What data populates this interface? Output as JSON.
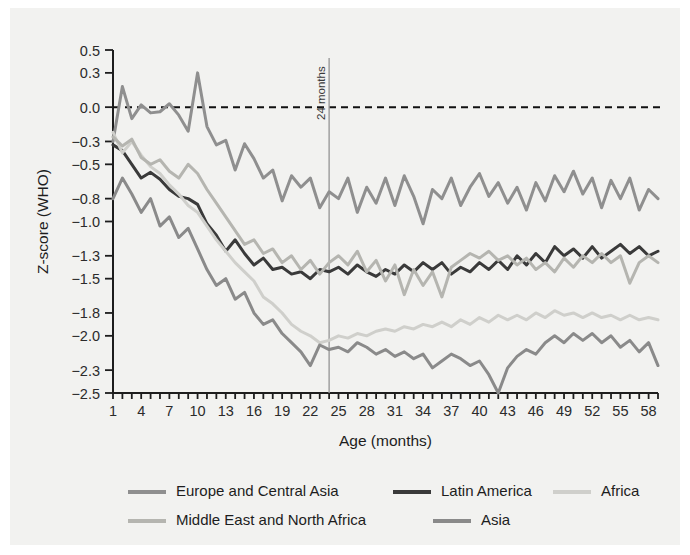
{
  "figure": {
    "background": "#f2f2f0",
    "page_background": "#ffffff"
  },
  "chart_data": {
    "type": "line",
    "title": "",
    "xlabel": "Age (months)",
    "ylabel": "Z-score (WHO)",
    "xlim": [
      1,
      59
    ],
    "ylim": [
      -2.5,
      0.5
    ],
    "grid": false,
    "legend_position": "bottom",
    "y_ticks": [
      0.5,
      0.3,
      0.0,
      -0.3,
      -0.5,
      -0.8,
      -1.0,
      -1.3,
      -1.5,
      -1.8,
      -2.0,
      -2.3,
      -2.5
    ],
    "y_tick_labels": [
      "0.5",
      "0.3",
      "0.0",
      "−0.3",
      "−0.5",
      "−0.8",
      "−1.0",
      "−1.3",
      "−1.5",
      "−1.8",
      "−2.0",
      "−2.3",
      "−2.5"
    ],
    "x_ticks": [
      1,
      4,
      7,
      10,
      13,
      16,
      19,
      22,
      25,
      28,
      31,
      34,
      37,
      40,
      43,
      46,
      49,
      52,
      55,
      58
    ],
    "x_tick_labels": [
      "1",
      "4",
      "7",
      "10",
      "13",
      "16",
      "19",
      "22",
      "25",
      "28",
      "31",
      "34",
      "37",
      "40",
      "43",
      "46",
      "49",
      "52",
      "55",
      "58"
    ],
    "x_minor_step": 1,
    "annotations": [
      {
        "text": "24 months",
        "x": 24,
        "orientation": "vertical",
        "line_color": "#9a9a9a"
      }
    ],
    "reference_lines": [
      {
        "y": 0.0,
        "style": "dashed",
        "color": "#111111"
      }
    ],
    "x": [
      1,
      2,
      3,
      4,
      5,
      6,
      7,
      8,
      9,
      10,
      11,
      12,
      13,
      14,
      15,
      16,
      17,
      18,
      19,
      20,
      21,
      22,
      23,
      24,
      25,
      26,
      27,
      28,
      29,
      30,
      31,
      32,
      33,
      34,
      35,
      36,
      37,
      38,
      39,
      40,
      41,
      42,
      43,
      44,
      45,
      46,
      47,
      48,
      49,
      50,
      51,
      52,
      53,
      54,
      55,
      56,
      57,
      58,
      59
    ],
    "series": [
      {
        "name": "Europe and Central Asia",
        "color": "#8f8f8f",
        "width": 3.0,
        "values": [
          -0.3,
          0.18,
          -0.1,
          0.02,
          -0.05,
          -0.04,
          0.03,
          -0.07,
          -0.21,
          0.3,
          -0.17,
          -0.33,
          -0.29,
          -0.55,
          -0.32,
          -0.45,
          -0.62,
          -0.55,
          -0.82,
          -0.6,
          -0.7,
          -0.62,
          -0.88,
          -0.74,
          -0.8,
          -0.62,
          -0.92,
          -0.7,
          -0.84,
          -0.62,
          -0.86,
          -0.6,
          -0.78,
          -1.02,
          -0.72,
          -0.8,
          -0.62,
          -0.86,
          -0.7,
          -0.58,
          -0.78,
          -0.66,
          -0.84,
          -0.7,
          -0.9,
          -0.66,
          -0.82,
          -0.6,
          -0.74,
          -0.56,
          -0.76,
          -0.62,
          -0.88,
          -0.64,
          -0.8,
          -0.62,
          -0.9,
          -0.72,
          -0.8
        ]
      },
      {
        "name": "Latin America",
        "color": "#3a3a3a",
        "width": 3.0,
        "values": [
          -0.33,
          -0.38,
          -0.5,
          -0.62,
          -0.57,
          -0.63,
          -0.72,
          -0.78,
          -0.8,
          -0.85,
          -1.02,
          -1.12,
          -1.26,
          -1.16,
          -1.28,
          -1.38,
          -1.32,
          -1.42,
          -1.4,
          -1.46,
          -1.44,
          -1.5,
          -1.42,
          -1.44,
          -1.4,
          -1.46,
          -1.38,
          -1.44,
          -1.48,
          -1.42,
          -1.46,
          -1.38,
          -1.44,
          -1.36,
          -1.42,
          -1.36,
          -1.46,
          -1.4,
          -1.44,
          -1.36,
          -1.42,
          -1.34,
          -1.42,
          -1.3,
          -1.38,
          -1.28,
          -1.36,
          -1.22,
          -1.3,
          -1.24,
          -1.32,
          -1.22,
          -1.32,
          -1.26,
          -1.2,
          -1.28,
          -1.22,
          -1.3,
          -1.26
        ]
      },
      {
        "name": "Africa",
        "color": "#cfcfcb",
        "width": 3.0,
        "values": [
          -0.22,
          -0.4,
          -0.3,
          -0.42,
          -0.52,
          -0.58,
          -0.68,
          -0.76,
          -0.86,
          -0.92,
          -1.04,
          -1.16,
          -1.26,
          -1.36,
          -1.44,
          -1.52,
          -1.66,
          -1.72,
          -1.8,
          -1.9,
          -1.96,
          -2.0,
          -2.06,
          -2.04,
          -2.0,
          -2.02,
          -1.98,
          -2.0,
          -1.96,
          -1.94,
          -1.96,
          -1.92,
          -1.94,
          -1.9,
          -1.92,
          -1.88,
          -1.92,
          -1.86,
          -1.9,
          -1.84,
          -1.88,
          -1.82,
          -1.86,
          -1.82,
          -1.86,
          -1.8,
          -1.84,
          -1.78,
          -1.82,
          -1.8,
          -1.84,
          -1.8,
          -1.84,
          -1.82,
          -1.86,
          -1.82,
          -1.86,
          -1.84,
          -1.86
        ]
      },
      {
        "name": "Middle East and North Africa",
        "color": "#b5b5b0",
        "width": 3.0,
        "values": [
          -0.26,
          -0.34,
          -0.28,
          -0.44,
          -0.5,
          -0.46,
          -0.56,
          -0.62,
          -0.5,
          -0.58,
          -0.72,
          -0.84,
          -0.96,
          -1.08,
          -1.2,
          -1.16,
          -1.28,
          -1.24,
          -1.36,
          -1.3,
          -1.42,
          -1.34,
          -1.46,
          -1.36,
          -1.3,
          -1.38,
          -1.26,
          -1.44,
          -1.34,
          -1.52,
          -1.38,
          -1.64,
          -1.42,
          -1.56,
          -1.44,
          -1.66,
          -1.4,
          -1.34,
          -1.28,
          -1.32,
          -1.26,
          -1.34,
          -1.3,
          -1.38,
          -1.32,
          -1.42,
          -1.36,
          -1.44,
          -1.32,
          -1.4,
          -1.3,
          -1.36,
          -1.28,
          -1.36,
          -1.3,
          -1.54,
          -1.36,
          -1.3,
          -1.36
        ]
      },
      {
        "name": "Asia",
        "color": "#8a8a8a",
        "width": 3.0,
        "values": [
          -0.8,
          -0.62,
          -0.76,
          -0.92,
          -0.8,
          -1.04,
          -0.96,
          -1.14,
          -1.06,
          -1.24,
          -1.42,
          -1.56,
          -1.5,
          -1.68,
          -1.62,
          -1.8,
          -1.9,
          -1.86,
          -1.98,
          -2.06,
          -2.14,
          -2.26,
          -2.08,
          -2.12,
          -2.1,
          -2.14,
          -2.06,
          -2.1,
          -2.16,
          -2.12,
          -2.18,
          -2.14,
          -2.2,
          -2.16,
          -2.28,
          -2.22,
          -2.16,
          -2.2,
          -2.26,
          -2.22,
          -2.34,
          -2.5,
          -2.28,
          -2.18,
          -2.12,
          -2.16,
          -2.06,
          -2.0,
          -2.06,
          -1.98,
          -2.04,
          -1.98,
          -2.06,
          -2.0,
          -2.1,
          -2.04,
          -2.14,
          -2.06,
          -2.26
        ]
      }
    ],
    "legend": [
      {
        "label": "Europe and Central Asia",
        "color": "#8f8f8f"
      },
      {
        "label": "Latin America",
        "color": "#3a3a3a"
      },
      {
        "label": "Africa",
        "color": "#cfcfcb"
      },
      {
        "label": "Middle East and North Africa",
        "color": "#b5b5b0"
      },
      {
        "label": "Asia",
        "color": "#8a8a8a"
      }
    ]
  }
}
